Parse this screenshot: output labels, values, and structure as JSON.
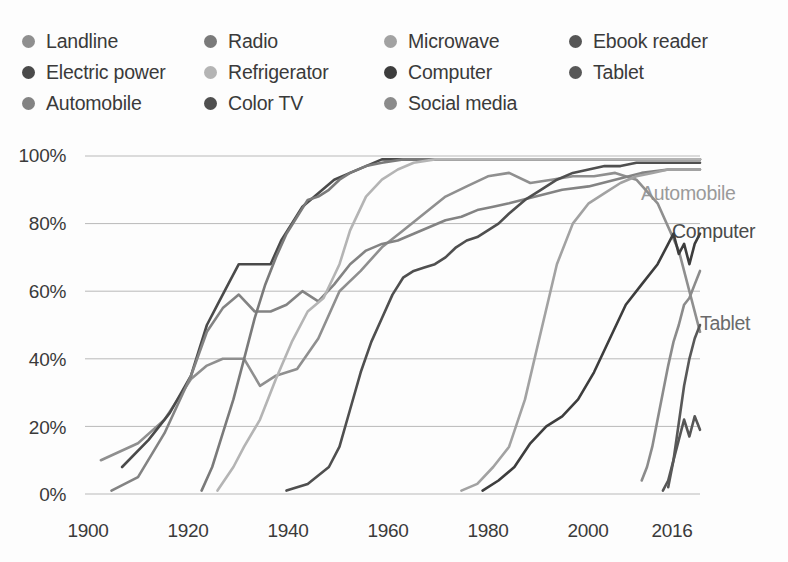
{
  "legend": {
    "rows": [
      [
        {
          "label": "Landline",
          "color": "#8f8f8f"
        },
        {
          "label": "Radio",
          "color": "#7a7a7a"
        },
        {
          "label": "Microwave",
          "color": "#a2a2a2"
        },
        {
          "label": "Ebook reader",
          "color": "#565656"
        }
      ],
      [
        {
          "label": "Electric power",
          "color": "#4a4a4a"
        },
        {
          "label": "Refrigerator",
          "color": "#b4b4b4"
        },
        {
          "label": "Computer",
          "color": "#3d3d3d"
        },
        {
          "label": "Tablet",
          "color": "#585858"
        }
      ],
      [
        {
          "label": "Automobile",
          "color": "#838383"
        },
        {
          "label": "Color TV",
          "color": "#4f4f4f"
        },
        {
          "label": "Social media",
          "color": "#8b8b8b"
        }
      ]
    ]
  },
  "annotations": [
    {
      "text": "Automobile",
      "x": 641,
      "y": 52,
      "color": "#9a9a9a"
    },
    {
      "text": "Computer",
      "x": 672,
      "y": 90,
      "color": "#4a4a4a"
    },
    {
      "text": "Tablet",
      "x": 700,
      "y": 182,
      "color": "#6a6a6a"
    }
  ],
  "axes": {
    "y_ticks": [
      "0%",
      "20%",
      "40%",
      "60%",
      "80%",
      "100%"
    ],
    "x_ticks": [
      "1900",
      "1920",
      "1940",
      "1960",
      "1980",
      "2000",
      "2016"
    ]
  },
  "chart_data": {
    "type": "line",
    "title": "",
    "xlabel": "",
    "ylabel": "",
    "xlim": [
      1900,
      2016
    ],
    "ylim": [
      0,
      100
    ],
    "y_ticks": [
      0,
      20,
      40,
      60,
      80,
      100
    ],
    "x_ticks": [
      1900,
      1920,
      1940,
      1960,
      1980,
      2000,
      2016
    ],
    "grid": "horizontal",
    "legend_position": "top",
    "series": [
      {
        "name": "Landline",
        "color": "#8f8f8f",
        "points": [
          [
            1903,
            10
          ],
          [
            1910,
            15
          ],
          [
            1915,
            22
          ],
          [
            1920,
            34
          ],
          [
            1923,
            38
          ],
          [
            1926,
            40
          ],
          [
            1930,
            40
          ],
          [
            1933,
            32
          ],
          [
            1936,
            35
          ],
          [
            1940,
            37
          ],
          [
            1944,
            46
          ],
          [
            1948,
            60
          ],
          [
            1952,
            66
          ],
          [
            1956,
            73
          ],
          [
            1960,
            78
          ],
          [
            1964,
            83
          ],
          [
            1968,
            88
          ],
          [
            1972,
            91
          ],
          [
            1976,
            94
          ],
          [
            1980,
            95
          ],
          [
            1984,
            92
          ],
          [
            1988,
            93
          ],
          [
            1992,
            94
          ],
          [
            1996,
            94
          ],
          [
            2000,
            95
          ],
          [
            2004,
            93
          ],
          [
            2008,
            86
          ],
          [
            2012,
            72
          ],
          [
            2016,
            48
          ]
        ]
      },
      {
        "name": "Electric power",
        "color": "#4a4a4a",
        "points": [
          [
            1907,
            8
          ],
          [
            1912,
            16
          ],
          [
            1916,
            24
          ],
          [
            1920,
            35
          ],
          [
            1923,
            50
          ],
          [
            1925,
            56
          ],
          [
            1927,
            62
          ],
          [
            1929,
            68
          ],
          [
            1931,
            68
          ],
          [
            1933,
            68
          ],
          [
            1935,
            68
          ],
          [
            1937,
            75
          ],
          [
            1939,
            80
          ],
          [
            1941,
            85
          ],
          [
            1944,
            89
          ],
          [
            1947,
            93
          ],
          [
            1950,
            95
          ],
          [
            1953,
            97
          ],
          [
            1956,
            99
          ],
          [
            1960,
            99
          ],
          [
            1970,
            99
          ],
          [
            1980,
            99
          ],
          [
            1990,
            99
          ],
          [
            2000,
            99
          ],
          [
            2016,
            99
          ]
        ]
      },
      {
        "name": "Automobile",
        "color": "#838383",
        "points": [
          [
            1905,
            1
          ],
          [
            1910,
            5
          ],
          [
            1915,
            18
          ],
          [
            1920,
            35
          ],
          [
            1923,
            48
          ],
          [
            1926,
            55
          ],
          [
            1929,
            59
          ],
          [
            1932,
            54
          ],
          [
            1935,
            54
          ],
          [
            1938,
            56
          ],
          [
            1941,
            60
          ],
          [
            1944,
            57
          ],
          [
            1947,
            62
          ],
          [
            1950,
            68
          ],
          [
            1953,
            72
          ],
          [
            1956,
            74
          ],
          [
            1959,
            75
          ],
          [
            1962,
            77
          ],
          [
            1965,
            79
          ],
          [
            1968,
            81
          ],
          [
            1971,
            82
          ],
          [
            1974,
            84
          ],
          [
            1977,
            85
          ],
          [
            1980,
            86
          ],
          [
            1985,
            88
          ],
          [
            1990,
            90
          ],
          [
            1995,
            91
          ],
          [
            2000,
            93
          ],
          [
            2005,
            95
          ],
          [
            2010,
            96
          ],
          [
            2016,
            96
          ]
        ]
      },
      {
        "name": "Radio",
        "color": "#7a7a7a",
        "points": [
          [
            1922,
            1
          ],
          [
            1924,
            8
          ],
          [
            1926,
            18
          ],
          [
            1928,
            28
          ],
          [
            1930,
            40
          ],
          [
            1932,
            52
          ],
          [
            1934,
            62
          ],
          [
            1936,
            70
          ],
          [
            1938,
            77
          ],
          [
            1940,
            82
          ],
          [
            1942,
            87
          ],
          [
            1944,
            88
          ],
          [
            1946,
            90
          ],
          [
            1948,
            93
          ],
          [
            1950,
            95
          ],
          [
            1953,
            97
          ],
          [
            1956,
            98
          ],
          [
            1960,
            99
          ],
          [
            1970,
            99
          ],
          [
            1980,
            99
          ],
          [
            1990,
            99
          ],
          [
            2000,
            99
          ],
          [
            2016,
            99
          ]
        ]
      },
      {
        "name": "Refrigerator",
        "color": "#b4b4b4",
        "points": [
          [
            1925,
            1
          ],
          [
            1928,
            8
          ],
          [
            1930,
            14
          ],
          [
            1933,
            22
          ],
          [
            1936,
            34
          ],
          [
            1939,
            45
          ],
          [
            1942,
            54
          ],
          [
            1945,
            58
          ],
          [
            1948,
            68
          ],
          [
            1950,
            78
          ],
          [
            1953,
            88
          ],
          [
            1956,
            93
          ],
          [
            1959,
            96
          ],
          [
            1962,
            98
          ],
          [
            1966,
            99
          ],
          [
            1970,
            99
          ],
          [
            1980,
            99
          ],
          [
            1990,
            99
          ],
          [
            2000,
            99
          ],
          [
            2016,
            99
          ]
        ]
      },
      {
        "name": "Color TV",
        "color": "#4f4f4f",
        "points": [
          [
            1938,
            1
          ],
          [
            1942,
            3
          ],
          [
            1946,
            8
          ],
          [
            1948,
            14
          ],
          [
            1950,
            25
          ],
          [
            1952,
            36
          ],
          [
            1954,
            45
          ],
          [
            1956,
            52
          ],
          [
            1958,
            59
          ],
          [
            1960,
            64
          ],
          [
            1962,
            66
          ],
          [
            1964,
            67
          ],
          [
            1966,
            68
          ],
          [
            1968,
            70
          ],
          [
            1970,
            73
          ],
          [
            1972,
            75
          ],
          [
            1974,
            76
          ],
          [
            1976,
            78
          ],
          [
            1978,
            80
          ],
          [
            1980,
            83
          ],
          [
            1983,
            87
          ],
          [
            1986,
            90
          ],
          [
            1989,
            93
          ],
          [
            1992,
            95
          ],
          [
            1995,
            96
          ],
          [
            1998,
            97
          ],
          [
            2001,
            97
          ],
          [
            2004,
            98
          ],
          [
            2008,
            98
          ],
          [
            2012,
            98
          ],
          [
            2016,
            98
          ]
        ]
      },
      {
        "name": "Microwave",
        "color": "#a2a2a2",
        "points": [
          [
            1971,
            1
          ],
          [
            1974,
            3
          ],
          [
            1977,
            8
          ],
          [
            1980,
            14
          ],
          [
            1983,
            28
          ],
          [
            1986,
            48
          ],
          [
            1989,
            68
          ],
          [
            1992,
            80
          ],
          [
            1995,
            86
          ],
          [
            1998,
            89
          ],
          [
            2001,
            92
          ],
          [
            2004,
            94
          ],
          [
            2007,
            95
          ],
          [
            2010,
            96
          ],
          [
            2013,
            96
          ],
          [
            2016,
            96
          ]
        ]
      },
      {
        "name": "Computer",
        "color": "#3d3d3d",
        "points": [
          [
            1975,
            1
          ],
          [
            1978,
            4
          ],
          [
            1981,
            8
          ],
          [
            1984,
            15
          ],
          [
            1987,
            20
          ],
          [
            1990,
            23
          ],
          [
            1993,
            28
          ],
          [
            1996,
            36
          ],
          [
            1999,
            46
          ],
          [
            2002,
            56
          ],
          [
            2005,
            62
          ],
          [
            2008,
            68
          ],
          [
            2010,
            74
          ],
          [
            2011,
            77
          ],
          [
            2012,
            71
          ],
          [
            2013,
            74
          ],
          [
            2014,
            68
          ],
          [
            2015,
            74
          ],
          [
            2016,
            77
          ]
        ]
      },
      {
        "name": "Social media",
        "color": "#8b8b8b",
        "points": [
          [
            2005,
            4
          ],
          [
            2006,
            8
          ],
          [
            2007,
            14
          ],
          [
            2008,
            22
          ],
          [
            2009,
            30
          ],
          [
            2010,
            38
          ],
          [
            2011,
            45
          ],
          [
            2012,
            50
          ],
          [
            2013,
            56
          ],
          [
            2014,
            58
          ],
          [
            2015,
            62
          ],
          [
            2016,
            66
          ]
        ]
      },
      {
        "name": "Ebook reader",
        "color": "#565656",
        "points": [
          [
            2009,
            1
          ],
          [
            2010,
            4
          ],
          [
            2011,
            10
          ],
          [
            2012,
            16
          ],
          [
            2013,
            22
          ],
          [
            2014,
            17
          ],
          [
            2015,
            23
          ],
          [
            2016,
            19
          ]
        ]
      },
      {
        "name": "Tablet",
        "color": "#585858",
        "points": [
          [
            2010,
            2
          ],
          [
            2011,
            10
          ],
          [
            2012,
            21
          ],
          [
            2013,
            32
          ],
          [
            2014,
            40
          ],
          [
            2015,
            46
          ],
          [
            2016,
            50
          ]
        ]
      }
    ]
  }
}
